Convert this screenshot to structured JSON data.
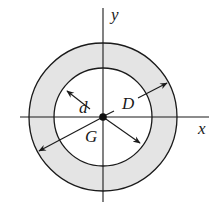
{
  "diagram": {
    "type": "annulus-cross-section",
    "colors": {
      "fill": "#e4e4e4",
      "stroke": "#1a1a1a",
      "background": "#ffffff"
    },
    "geometry": {
      "center": [
        103,
        117
      ],
      "outer_radius": 74,
      "inner_radius": 49
    },
    "axes": {
      "x_label": "x",
      "y_label": "y"
    },
    "labels": {
      "inner_diameter": "d",
      "outer_diameter": "D",
      "centroid": "G"
    }
  }
}
